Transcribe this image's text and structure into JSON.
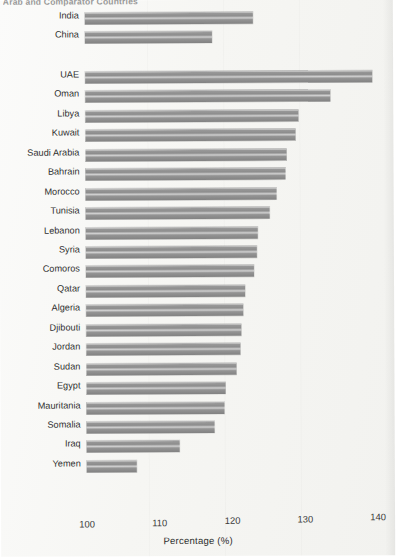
{
  "chart_data": {
    "type": "bar",
    "orientation": "horizontal",
    "title": "Arab and Comparator Countries",
    "xlabel": "Percentage (%)",
    "ylabel": "",
    "xlim": [
      100,
      140
    ],
    "xticks": [
      100,
      110,
      120,
      130,
      140
    ],
    "grid": false,
    "legend": null,
    "bar_color": "#8d8d8d",
    "background_color": "#f6f6f3",
    "groups": [
      {
        "name": "comparators",
        "categories": [
          "India",
          "China"
        ],
        "values": [
          123.1,
          117.5
        ]
      },
      {
        "name": "arab-countries",
        "categories": [
          "UAE",
          "Oman",
          "Libya",
          "Kuwait",
          "Saudi Arabia",
          "Bahrain",
          "Morocco",
          "Tunisia",
          "Lebanon",
          "Syria",
          "Comoros",
          "Qatar",
          "Algeria",
          "Djibouti",
          "Jordan",
          "Sudan",
          "Egypt",
          "Mauritania",
          "Somalia",
          "Iraq",
          "Yemen"
        ],
        "values": [
          139.4,
          133.7,
          129.3,
          128.9,
          127.6,
          127.5,
          126.3,
          125.3,
          123.7,
          123.5,
          123.1,
          121.9,
          121.6,
          121.3,
          121.1,
          120.6,
          119.1,
          119.0,
          117.6,
          112.8,
          106.9
        ]
      }
    ],
    "categories": [
      "India",
      "China",
      "UAE",
      "Oman",
      "Libya",
      "Kuwait",
      "Saudi Arabia",
      "Bahrain",
      "Morocco",
      "Tunisia",
      "Lebanon",
      "Syria",
      "Comoros",
      "Qatar",
      "Algeria",
      "Djibouti",
      "Jordan",
      "Sudan",
      "Egypt",
      "Mauritania",
      "Somalia",
      "Iraq",
      "Yemen"
    ],
    "values": [
      123.1,
      117.5,
      139.4,
      133.7,
      129.3,
      128.9,
      127.6,
      127.5,
      126.3,
      125.3,
      123.7,
      123.5,
      123.1,
      121.9,
      121.6,
      121.3,
      121.1,
      120.6,
      119.1,
      119.0,
      117.6,
      112.8,
      106.9
    ]
  }
}
